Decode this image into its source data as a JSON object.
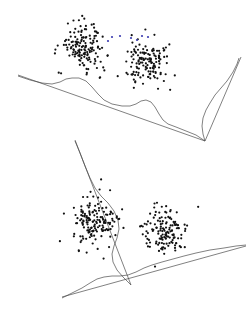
{
  "figure": {
    "title": "",
    "background": "#ffffff",
    "panel_count": 2
  },
  "style": {
    "point_color": "#111111",
    "accent_point_color": "#3b3bb0",
    "line_color": "#4a4a4a",
    "point_radius": 1.1,
    "line_width": 0.7
  },
  "chart_data": {
    "type": "scatter",
    "title": "",
    "subtitle": "",
    "xlabel": "",
    "ylabel": "",
    "grid": false,
    "legend": null,
    "xlim": [
      0,
      250
    ],
    "ylim": [
      0,
      317
    ],
    "panels": [
      {
        "name": "upper-panel",
        "axes": [
          {
            "name": "upper-baseline-axis",
            "x1": 18,
            "y1": 75,
            "x2": 205,
            "y2": 141
          },
          {
            "name": "upper-right-axis",
            "x1": 205,
            "y1": 141,
            "x2": 241,
            "y2": 57
          }
        ],
        "density_curves": [
          {
            "name": "upper-baseline-density",
            "points": [
              [
                18,
                76
              ],
              [
                30,
                80
              ],
              [
                42,
                83
              ],
              [
                52,
                84
              ],
              [
                60,
                82
              ],
              [
                66,
                79
              ],
              [
                72,
                78
              ],
              [
                79,
                78
              ],
              [
                86,
                81
              ],
              [
                92,
                87
              ],
              [
                98,
                94
              ],
              [
                104,
                100
              ],
              [
                112,
                104
              ],
              [
                122,
                106
              ],
              [
                130,
                106
              ],
              [
                136,
                104
              ],
              [
                141,
                101
              ],
              [
                146,
                100
              ],
              [
                151,
                102
              ],
              [
                155,
                107
              ],
              [
                159,
                114
              ],
              [
                163,
                120
              ],
              [
                168,
                124
              ],
              [
                176,
                127
              ],
              [
                186,
                131
              ],
              [
                196,
                135
              ],
              [
                205,
                141
              ]
            ]
          },
          {
            "name": "upper-right-density",
            "points": [
              [
                205,
                141
              ],
              [
                203,
                134
              ],
              [
                202,
                126
              ],
              [
                203,
                118
              ],
              [
                206,
                110
              ],
              [
                210,
                103
              ],
              [
                215,
                95
              ],
              [
                221,
                88
              ],
              [
                227,
                81
              ],
              [
                233,
                72
              ],
              [
                237,
                64
              ],
              [
                239,
                58
              ]
            ]
          }
        ],
        "clusters": [
          {
            "name": "upper-left-cluster",
            "cx": 83,
            "cy": 47,
            "sx": 22,
            "sy": 23,
            "n": 150,
            "seed": 17
          },
          {
            "name": "upper-right-cluster",
            "cx": 147,
            "cy": 63,
            "sx": 21,
            "sy": 22,
            "n": 138,
            "seed": 53
          }
        ],
        "accent_points": [
          [
            112,
            37
          ],
          [
            120,
            36
          ],
          [
            131,
            38
          ],
          [
            142,
            36
          ],
          [
            148,
            37
          ],
          [
            108,
            41
          ],
          [
            137,
            40
          ]
        ]
      },
      {
        "name": "lower-panel",
        "axes": [
          {
            "name": "lower-slanted-axis",
            "x1": 75,
            "y1": 140,
            "x2": 131,
            "y2": 285
          },
          {
            "name": "lower-baseline-axis",
            "x1": 62,
            "y1": 297,
            "x2": 246,
            "y2": 246
          }
        ],
        "density_curves": [
          {
            "name": "lower-slanted-density",
            "points": [
              [
                75,
                141
              ],
              [
                80,
                153
              ],
              [
                85,
                166
              ],
              [
                90,
                178
              ],
              [
                95,
                188
              ],
              [
                101,
                196
              ],
              [
                108,
                203
              ],
              [
                114,
                211
              ],
              [
                118,
                220
              ],
              [
                119,
                229
              ],
              [
                117,
                238
              ],
              [
                114,
                246
              ],
              [
                112,
                254
              ],
              [
                113,
                262
              ],
              [
                117,
                270
              ],
              [
                123,
                277
              ],
              [
                128,
                282
              ],
              [
                131,
                285
              ]
            ]
          },
          {
            "name": "lower-baseline-density",
            "points": [
              [
                62,
                298
              ],
              [
                72,
                293
              ],
              [
                82,
                288
              ],
              [
                90,
                283
              ],
              [
                97,
                279
              ],
              [
                104,
                277
              ],
              [
                112,
                276
              ],
              [
                120,
                276
              ],
              [
                128,
                275
              ],
              [
                136,
                272
              ],
              [
                144,
                268
              ],
              [
                152,
                265
              ],
              [
                162,
                262
              ],
              [
                173,
                259
              ],
              [
                184,
                256
              ],
              [
                196,
                253
              ],
              [
                210,
                250
              ],
              [
                224,
                248
              ],
              [
                236,
                246
              ],
              [
                246,
                245
              ]
            ]
          }
        ],
        "clusters": [
          {
            "name": "lower-left-cluster",
            "cx": 95,
            "cy": 222,
            "sx": 23,
            "sy": 24,
            "n": 160,
            "seed": 91
          },
          {
            "name": "lower-right-cluster",
            "cx": 165,
            "cy": 231,
            "sx": 21,
            "sy": 22,
            "n": 140,
            "seed": 7
          }
        ],
        "accent_points": []
      }
    ]
  }
}
